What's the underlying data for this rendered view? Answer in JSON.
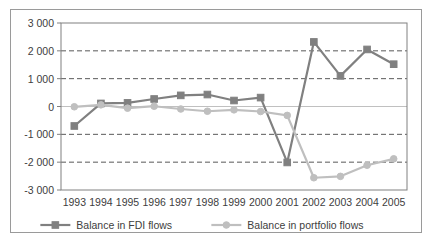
{
  "chart_data": {
    "type": "line",
    "title": "",
    "xlabel": "",
    "ylabel": "",
    "categories": [
      "1993",
      "1994",
      "1995",
      "1996",
      "1997",
      "1998",
      "1999",
      "2000",
      "2001",
      "2002",
      "2003",
      "2004",
      "2005"
    ],
    "ylim": [
      -3000,
      3000
    ],
    "yticks": [
      3000,
      2000,
      1000,
      0,
      -1000,
      -2000,
      -3000
    ],
    "ytick_labels": [
      "3 000",
      "2 000",
      "1 000",
      "0",
      "-1 000",
      "-2 000",
      "-3 000"
    ],
    "grid": "horizontal-dashed",
    "legend_position": "bottom",
    "series": [
      {
        "name": "Balance in FDI flows",
        "color": "#808080",
        "marker": "square",
        "values": [
          -700,
          110,
          130,
          270,
          400,
          430,
          215,
          320,
          -2010,
          2320,
          1100,
          2050,
          1520
        ]
      },
      {
        "name": "Balance in portfolio flows",
        "color": "#bfbfbf",
        "marker": "circle",
        "values": [
          -10,
          60,
          -60,
          10,
          -90,
          -170,
          -120,
          -180,
          -320,
          -2560,
          -2510,
          -2110,
          -1880
        ]
      }
    ]
  },
  "legend": {
    "items": [
      {
        "label": "Balance in FDI flows",
        "color": "#808080",
        "marker": "square"
      },
      {
        "label": "Balance in portfolio flows",
        "color": "#bfbfbf",
        "marker": "circle"
      }
    ]
  },
  "colors": {
    "fdi": "#808080",
    "portfolio": "#bfbfbf",
    "grid": "#595959",
    "axis": "#808080",
    "zero_line": "#c0c0c0",
    "text": "#404040",
    "frame_border": "#9a9a9a",
    "background": "#ffffff"
  }
}
